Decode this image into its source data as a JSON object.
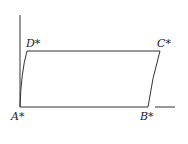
{
  "diagram": {
    "labels": {
      "A": "A*",
      "B": "B*",
      "C": "C*",
      "D": "D*"
    },
    "stroke_color": "#333333"
  }
}
